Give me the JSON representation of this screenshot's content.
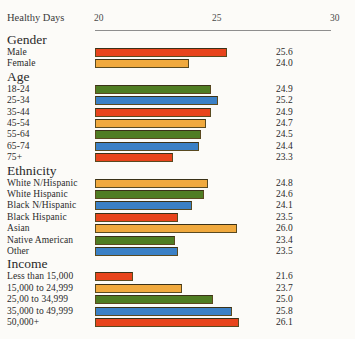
{
  "chart_data": {
    "type": "bar",
    "orientation": "horizontal",
    "title": "Healthy Days",
    "xlabel": "Healthy Days",
    "ylabel": "",
    "xlim": [
      20,
      30
    ],
    "xticks": [
      20,
      25,
      30
    ],
    "xtick_labels": [
      "20",
      "25",
      "30"
    ],
    "grid": false,
    "legend": null,
    "value_labels": true,
    "axis_baseline": 20,
    "palette": {
      "red": "#e8441c",
      "amber": "#f0a93e",
      "green": "#4f7d23",
      "blue": "#3b80c6",
      "background": "#fcfbf8",
      "axis": "#8e8e8e",
      "text": "#2a2a2a"
    },
    "groups": [
      {
        "name": "Gender",
        "rows": [
          {
            "label": "Male",
            "value": 25.6,
            "value_text": "25.6",
            "color": "red"
          },
          {
            "label": "Female",
            "value": 24.0,
            "value_text": "24.0",
            "color": "amber"
          }
        ]
      },
      {
        "name": "Age",
        "rows": [
          {
            "label": "18-24",
            "value": 24.9,
            "value_text": "24.9",
            "color": "green"
          },
          {
            "label": "25-34",
            "value": 25.2,
            "value_text": "25.2",
            "color": "blue"
          },
          {
            "label": "35-44",
            "value": 24.9,
            "value_text": "24.9",
            "color": "red"
          },
          {
            "label": "45-54",
            "value": 24.7,
            "value_text": "24.7",
            "color": "amber"
          },
          {
            "label": "55-64",
            "value": 24.5,
            "value_text": "24.5",
            "color": "green"
          },
          {
            "label": "65-74",
            "value": 24.4,
            "value_text": "24.4",
            "color": "blue"
          },
          {
            "label": "75+",
            "value": 23.3,
            "value_text": "23.3",
            "color": "red"
          }
        ]
      },
      {
        "name": "Ethnicity",
        "rows": [
          {
            "label": "White N/Hispanic",
            "value": 24.8,
            "value_text": "24.8",
            "color": "amber"
          },
          {
            "label": "White Hispanic",
            "value": 24.6,
            "value_text": "24.6",
            "color": "green"
          },
          {
            "label": "Black N/Hispanic",
            "value": 24.1,
            "value_text": "24.1",
            "color": "blue"
          },
          {
            "label": "Black Hispanic",
            "value": 23.5,
            "value_text": "23.5",
            "color": "red"
          },
          {
            "label": "Asian",
            "value": 26.0,
            "value_text": "26.0",
            "color": "amber"
          },
          {
            "label": "Native American",
            "value": 23.4,
            "value_text": "23.4",
            "color": "green"
          },
          {
            "label": "Other",
            "value": 23.5,
            "value_text": "23.5",
            "color": "blue"
          }
        ]
      },
      {
        "name": "Income",
        "rows": [
          {
            "label": "Less than 15,000",
            "value": 21.6,
            "value_text": "21.6",
            "color": "red"
          },
          {
            "label": "15,000 to 24,999",
            "value": 23.7,
            "value_text": "23.7",
            "color": "amber"
          },
          {
            "label": "25,00 to 34,999",
            "value": 25.0,
            "value_text": "25.0",
            "color": "green"
          },
          {
            "label": "35,000 to 49,999",
            "value": 25.8,
            "value_text": "25.8",
            "color": "blue"
          },
          {
            "label": "50,000+",
            "value": 26.1,
            "value_text": "26.1",
            "color": "red"
          }
        ]
      }
    ]
  }
}
